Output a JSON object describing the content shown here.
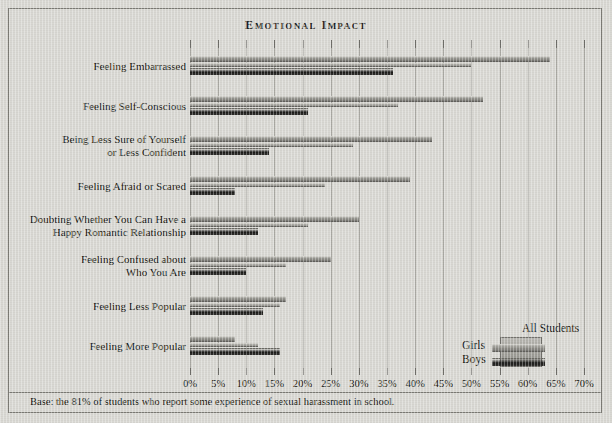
{
  "chart_data": {
    "type": "bar",
    "orientation": "horizontal",
    "title": "Emotional Impact",
    "xlabel": "",
    "ylabel": "",
    "xlim": [
      0,
      70
    ],
    "xtick_step": 5,
    "grid": true,
    "legend_position": "bottom-right",
    "categories": [
      "Feeling Embarrassed",
      "Feeling Self-Conscious",
      "Being Less Sure of Yourself or Less Confident",
      "Feeling Afraid or Scared",
      "Doubting Whether You Can Have a Happy Romantic Relationship",
      "Feeling Confused about Who You Are",
      "Feeling Less Popular",
      "Feeling More Popular"
    ],
    "tick_labels": [
      "0%",
      "5%",
      "10%",
      "15%",
      "20%",
      "25%",
      "30%",
      "35%",
      "40%",
      "45%",
      "50%",
      "55%",
      "60%",
      "65%",
      "70%"
    ],
    "series": [
      {
        "name": "Girls",
        "values": [
          64,
          52,
          43,
          39,
          30,
          25,
          17,
          8
        ]
      },
      {
        "name": "All Students",
        "values": [
          50,
          37,
          29,
          24,
          21,
          17,
          16,
          12
        ]
      },
      {
        "name": "Boys",
        "values": [
          36,
          21,
          14,
          8,
          12,
          10,
          13,
          16
        ]
      }
    ],
    "footnote": "Base: the 81% of students who report some experience of sexual harassment in school."
  },
  "chart": {
    "title": "Emotional Impact",
    "footnote": "Base: the 81% of students who report some experience of sexual harassment in school."
  },
  "categories": [
    {
      "line1": "Feeling Embarrassed",
      "line2": ""
    },
    {
      "line1": "Feeling Self-Conscious",
      "line2": ""
    },
    {
      "line1": "Being Less Sure of Yourself",
      "line2": "or Less Confident"
    },
    {
      "line1": "Feeling Afraid or Scared",
      "line2": ""
    },
    {
      "line1": "Doubting Whether You Can Have a",
      "line2": "Happy Romantic Relationship"
    },
    {
      "line1": "Feeling Confused about",
      "line2": "Who You Are"
    },
    {
      "line1": "Feeling Less Popular",
      "line2": ""
    },
    {
      "line1": "Feeling More Popular",
      "line2": ""
    }
  ],
  "axis": {
    "ticks": [
      "0%",
      "5%",
      "10%",
      "15%",
      "20%",
      "25%",
      "30%",
      "35%",
      "40%",
      "45%",
      "50%",
      "55%",
      "60%",
      "65%",
      "70%"
    ]
  },
  "legend": {
    "girls": "Girls",
    "boys": "Boys",
    "all_students": "All Students"
  },
  "colors": {
    "background": "#d8d7d2",
    "girls": "#8f8e88",
    "boys": "#1a1a18",
    "all_students": "#a2a19b",
    "frame": "#7b7a74",
    "text": "#16160f"
  }
}
